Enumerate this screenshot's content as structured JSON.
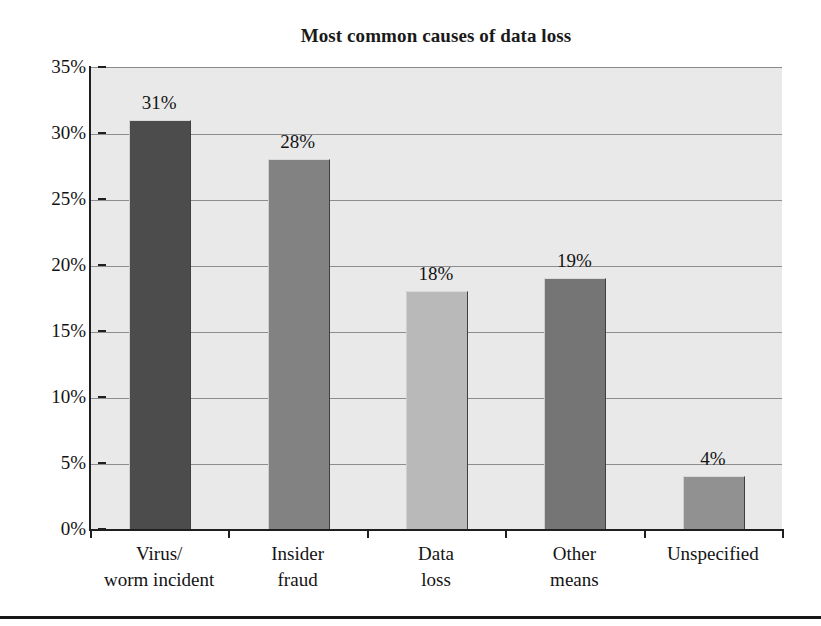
{
  "chart_data": {
    "type": "bar",
    "title": "Most common causes of data loss",
    "subtitle": "",
    "xlabel": "",
    "ylabel": "",
    "categories": [
      "Virus/\nworm incident",
      "Insider\nfraud",
      "Data\nloss",
      "Other\nmeans",
      "Unspecified"
    ],
    "values": [
      31,
      28,
      18,
      19,
      4
    ],
    "value_labels": [
      "31%",
      "28%",
      "18%",
      "19%",
      "4%"
    ],
    "bar_colors": [
      "#4c4c4c",
      "#828282",
      "#b9b9b9",
      "#757575",
      "#919191"
    ],
    "ylim": [
      0,
      35
    ],
    "yticks": [
      0,
      5,
      10,
      15,
      20,
      25,
      30,
      35
    ],
    "ytick_labels": [
      "0%",
      "5%",
      "10%",
      "15%",
      "20%",
      "25%",
      "30%",
      "35%"
    ],
    "grid": true,
    "grid_orientation": "horizontal",
    "legend": false,
    "legend_position": "none",
    "plot_background": "#e9e9e9",
    "units": "percent"
  },
  "figure": {
    "bottom_rule_color": "#17171a"
  }
}
